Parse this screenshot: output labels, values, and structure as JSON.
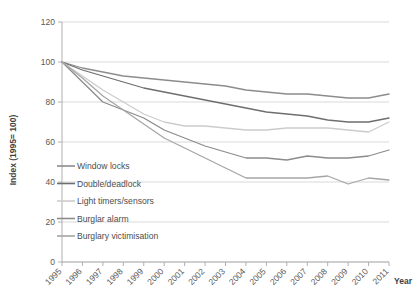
{
  "chart_data": {
    "type": "line",
    "title": "",
    "xlabel": "Year",
    "ylabel": "Index (1995= 100)",
    "ylim": [
      0,
      120
    ],
    "yticks": [
      0,
      20,
      40,
      60,
      80,
      100,
      120
    ],
    "grid": true,
    "legend_position": "inside-left",
    "categories": [
      "1995",
      "1996",
      "1997",
      "1998",
      "1999",
      "2000",
      "2001",
      "2002",
      "2003",
      "2004",
      "2005",
      "2006",
      "2007",
      "2008",
      "2009",
      "2010",
      "2011"
    ],
    "series": [
      {
        "name": "Window locks",
        "color": "#8c8c8c",
        "values": [
          100,
          97,
          95,
          93,
          92,
          91,
          90,
          89,
          88,
          86,
          85,
          84,
          84,
          83,
          82,
          82,
          84
        ]
      },
      {
        "name": "Double/deadlock",
        "color": "#6e6e6e",
        "values": [
          100,
          96,
          93,
          90,
          87,
          85,
          83,
          81,
          79,
          77,
          75,
          74,
          73,
          71,
          70,
          70,
          72
        ]
      },
      {
        "name": "Light timers/sensors",
        "color": "#cccccc",
        "values": [
          100,
          93,
          86,
          80,
          74,
          70,
          68,
          68,
          67,
          66,
          66,
          67,
          67,
          67,
          66,
          65,
          70
        ]
      },
      {
        "name": "Burglar alarm",
        "color": "#8c8c8c",
        "values": [
          100,
          90,
          80,
          76,
          72,
          66,
          62,
          58,
          55,
          52,
          52,
          51,
          53,
          52,
          52,
          53,
          56
        ]
      },
      {
        "name": "Burglary victimisation",
        "color": "#a6a6a6",
        "values": [
          100,
          92,
          83,
          76,
          69,
          62,
          57,
          52,
          47,
          42,
          42,
          42,
          42,
          43,
          39,
          42,
          41
        ]
      }
    ]
  },
  "legend": {
    "items": [
      {
        "label": "Window locks"
      },
      {
        "label": "Double/deadlock"
      },
      {
        "label": "Light timers/sensors"
      },
      {
        "label": "Burglar alarm"
      },
      {
        "label": "Burglary victimisation"
      }
    ]
  },
  "axes": {
    "y_title": "Index (1995= 100)",
    "x_title": "Year",
    "y_tick_labels": [
      "0",
      "20",
      "40",
      "60",
      "80",
      "100",
      "120"
    ],
    "x_tick_labels": [
      "1995",
      "1996",
      "1997",
      "1998",
      "1999",
      "2000",
      "2001",
      "2002",
      "2003",
      "2004",
      "2005",
      "2006",
      "2007",
      "2008",
      "2009",
      "2010",
      "2011"
    ]
  }
}
